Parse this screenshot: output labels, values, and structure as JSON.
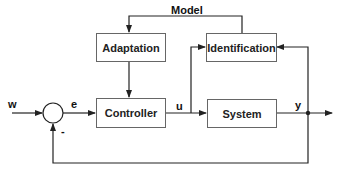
{
  "diagram": {
    "blocks": {
      "adaptation": "Adaptation",
      "identification": "Identification",
      "controller": "Controller",
      "system": "System"
    },
    "labels": {
      "model": "Model",
      "w": "w",
      "e": "e",
      "u": "u",
      "y": "y",
      "minus": "-"
    },
    "colors": {
      "line": "#222222",
      "box_border": "#666666",
      "background": "#ffffff"
    }
  }
}
